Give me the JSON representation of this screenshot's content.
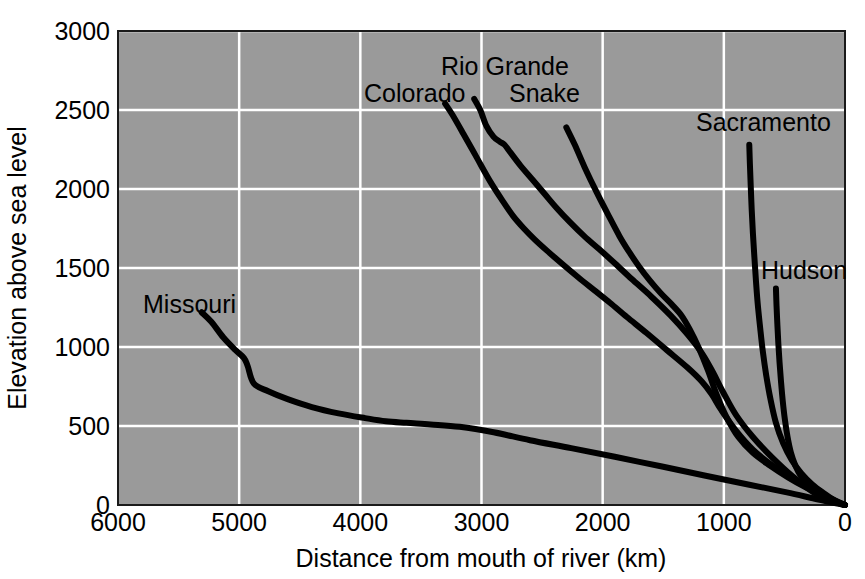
{
  "chart_data": {
    "type": "line",
    "title": "",
    "xlabel": "Distance from mouth of river (km)",
    "ylabel": "Elevation above sea level",
    "xlim": [
      6000,
      0
    ],
    "ylim": [
      0,
      3000
    ],
    "x_reversed": true,
    "grid": true,
    "legend_position": "inline-labels",
    "xticks": [
      6000,
      5000,
      4000,
      3000,
      2000,
      1000,
      0
    ],
    "xtick_labels": [
      "6000",
      "5000",
      "4000",
      "3000",
      "2000",
      "1000",
      "0"
    ],
    "yticks": [
      0,
      500,
      1000,
      1500,
      2000,
      2500,
      3000
    ],
    "ytick_labels": [
      "0",
      "500",
      "1000",
      "1500",
      "2000",
      "2500",
      "3000"
    ],
    "background_color": "#9a9a9a",
    "grid_color": "#ffffff",
    "line_color": "#000000",
    "series": [
      {
        "name": "Missouri",
        "label": "Missouri",
        "x": [
          5310,
          5230,
          5130,
          5030,
          4960,
          4930,
          4880,
          4760,
          4600,
          4400,
          4180,
          3960,
          3790,
          3620,
          3420,
          3180,
          2900,
          2600,
          2260,
          1900,
          1520,
          1150,
          800,
          480,
          220,
          0
        ],
        "y": [
          1220,
          1160,
          1060,
          980,
          930,
          880,
          770,
          720,
          670,
          620,
          580,
          550,
          530,
          520,
          510,
          495,
          460,
          410,
          360,
          305,
          245,
          185,
          130,
          80,
          35,
          0
        ]
      },
      {
        "name": "Colorado",
        "label": "Colorado",
        "x": [
          3300,
          3240,
          3150,
          3040,
          2930,
          2830,
          2740,
          2650,
          2560,
          2460,
          2340,
          2200,
          2070,
          1940,
          1800,
          1640,
          1470,
          1300,
          1180,
          1100,
          1020,
          900,
          760,
          600,
          430,
          250,
          100,
          0
        ],
        "y": [
          2540,
          2470,
          2350,
          2200,
          2050,
          1930,
          1830,
          1750,
          1680,
          1610,
          1530,
          1440,
          1360,
          1280,
          1190,
          1090,
          980,
          870,
          780,
          700,
          600,
          470,
          350,
          250,
          165,
          90,
          35,
          0
        ]
      },
      {
        "name": "Rio Grande",
        "label": "Rio Grande",
        "x": [
          3060,
          3010,
          2960,
          2900,
          2850,
          2810,
          2760,
          2680,
          2580,
          2480,
          2380,
          2270,
          2150,
          2030,
          1900,
          1760,
          1600,
          1440,
          1300,
          1180,
          1090,
          1010,
          900,
          760,
          600,
          430,
          250,
          100,
          0
        ],
        "y": [
          2570,
          2500,
          2400,
          2330,
          2300,
          2280,
          2230,
          2150,
          2060,
          1970,
          1880,
          1790,
          1700,
          1620,
          1530,
          1430,
          1320,
          1200,
          1080,
          960,
          840,
          720,
          570,
          430,
          300,
          180,
          75,
          25,
          0
        ]
      },
      {
        "name": "Snake",
        "label": "Snake",
        "x": [
          2300,
          2230,
          2150,
          2050,
          1950,
          1860,
          1780,
          1700,
          1610,
          1520,
          1430,
          1350,
          1280,
          1210,
          1130,
          1060,
          980,
          880,
          760,
          620,
          470,
          320,
          170,
          60,
          0
        ],
        "y": [
          2390,
          2280,
          2140,
          1980,
          1830,
          1700,
          1600,
          1510,
          1420,
          1340,
          1270,
          1200,
          1110,
          1000,
          850,
          700,
          560,
          430,
          330,
          250,
          175,
          110,
          55,
          15,
          0
        ]
      },
      {
        "name": "Sacramento",
        "label": "Sacramento",
        "x": [
          790,
          785,
          778,
          770,
          760,
          748,
          735,
          720,
          700,
          678,
          650,
          615,
          570,
          510,
          440,
          360,
          270,
          175,
          85,
          0
        ],
        "y": [
          2280,
          2160,
          2020,
          1870,
          1720,
          1570,
          1420,
          1270,
          1120,
          970,
          820,
          670,
          520,
          390,
          285,
          200,
          130,
          75,
          30,
          0
        ]
      },
      {
        "name": "Hudson",
        "label": "Hudson",
        "x": [
          570,
          565,
          558,
          550,
          540,
          528,
          514,
          496,
          474,
          446,
          410,
          365,
          310,
          250,
          185,
          120,
          55,
          0
        ],
        "y": [
          1370,
          1260,
          1140,
          1020,
          900,
          780,
          660,
          540,
          430,
          330,
          250,
          185,
          135,
          95,
          60,
          33,
          13,
          0
        ]
      }
    ],
    "series_labels": [
      {
        "name": "Missouri",
        "text": "Missouri",
        "x_px": 143,
        "y_px": 313
      },
      {
        "name": "Colorado",
        "text": "Colorado",
        "x_px": 364,
        "y_px": 102
      },
      {
        "name": "Rio Grande",
        "text": "Rio Grande",
        "x_px": 441,
        "y_px": 75
      },
      {
        "name": "Snake",
        "text": "Snake",
        "x_px": 509,
        "y_px": 102
      },
      {
        "name": "Sacramento",
        "text": "Sacramento",
        "x_px": 696,
        "y_px": 131
      },
      {
        "name": "Hudson",
        "text": "Hudson",
        "x_px": 761,
        "y_px": 279
      }
    ]
  }
}
